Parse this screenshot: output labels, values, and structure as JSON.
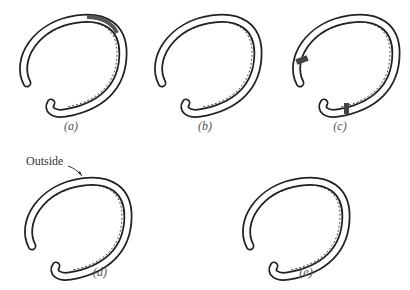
{
  "figure": {
    "panels": [
      {
        "id": "a",
        "label": "(a)",
        "description": "Horseshoe with clip at toe-quarter"
      },
      {
        "id": "b",
        "label": "(b)",
        "description": "Plain fullered horseshoe"
      },
      {
        "id": "c",
        "label": "(c)",
        "description": "Horseshoe with calks at heels"
      },
      {
        "id": "d",
        "label": "(d)",
        "description": "Horseshoe, outside edge indicated",
        "callout": "Outside"
      },
      {
        "id": "e",
        "label": "(e)",
        "description": "Plain rounded horseshoe"
      }
    ],
    "colors": {
      "ink": "#222222",
      "background": "#ffffff"
    }
  }
}
